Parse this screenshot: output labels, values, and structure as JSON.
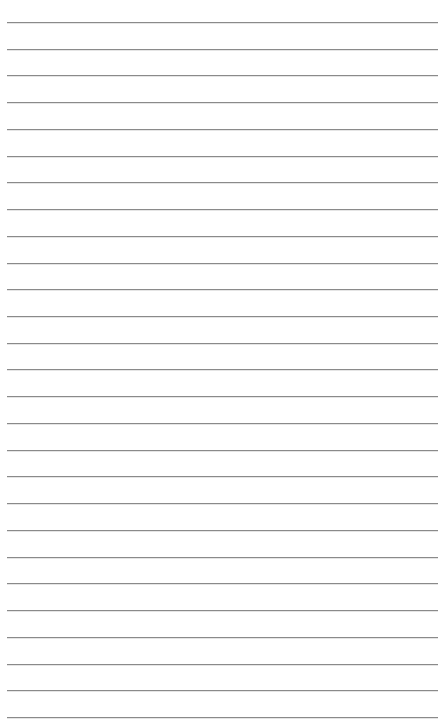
{
  "document": {
    "type": "lined-paper",
    "background_color": "#ffffff",
    "rule_color": "#8a8a8a",
    "rule_count": 27,
    "first_rule_y": 22,
    "rule_spacing": 26.73,
    "rule_left": 7,
    "rule_right": 438
  }
}
